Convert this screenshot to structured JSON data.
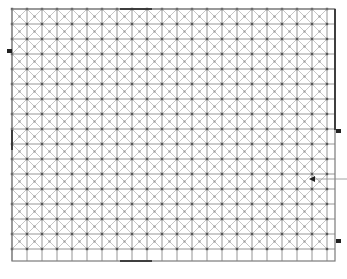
{
  "diagram": {
    "type": "diagonal-grid-mesh",
    "frame": {
      "x": 12,
      "y": 9,
      "width": 323,
      "height": 252
    },
    "cell_size": 15,
    "colors": {
      "background": "#ffffff",
      "grid_line": "#8a8a8a",
      "diagonal_line": "#b8b8b8",
      "node": "#555555",
      "border": "#7a7a7a",
      "border_emphasis": "#333333",
      "marker": "#222222"
    },
    "emphasized_edges": [
      {
        "side": "top",
        "from": 120,
        "to": 152
      },
      {
        "side": "bottom",
        "from": 120,
        "to": 152
      },
      {
        "side": "left",
        "from": 130,
        "to": 150
      },
      {
        "side": "right",
        "from": 9,
        "to": 130
      }
    ],
    "markers": [
      {
        "name": "left-marker",
        "x": 12,
        "y": 51,
        "dir": "left"
      },
      {
        "name": "right-marker-upper",
        "x": 335,
        "y": 131,
        "dir": "right"
      },
      {
        "name": "right-marker-lower",
        "x": 335,
        "y": 241,
        "dir": "right"
      }
    ],
    "pointer": {
      "x": 312,
      "y": 179,
      "line_to_x": 347
    }
  }
}
